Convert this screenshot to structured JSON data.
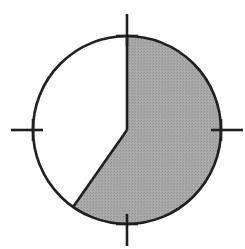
{
  "figure": {
    "name": "pie-sector-clock-diagram",
    "canvas": {
      "width": 245,
      "height": 249,
      "background": "#ffffff"
    }
  },
  "circle": {
    "center_x": 127,
    "center_y": 130,
    "radius": 94,
    "stroke_color": "#1f1f1f",
    "stroke_width": 2.6,
    "fill_color": "#ffffff"
  },
  "sector": {
    "label": "shaded-sector",
    "fill_color": "#a0a0a0",
    "texture": "halftone-dither",
    "start_angle_deg": 0,
    "end_angle_deg": 215,
    "sweep_deg": 215,
    "fraction_of_circle": 0.597,
    "start_clock_position": "12 o'clock",
    "end_clock_position": "lower-left"
  },
  "radii": [
    {
      "name": "radius-vertical-up",
      "angle_deg": 0,
      "from": "center",
      "to": "top of circle",
      "stroke_color": "#1f1f1f",
      "stroke_width": 2.6
    },
    {
      "name": "radius-diagonal-lower-left",
      "angle_deg": 215,
      "from": "center",
      "to": "lower-left edge of circle",
      "stroke_color": "#1f1f1f",
      "stroke_width": 2.6
    }
  ],
  "tick_marks": [
    {
      "name": "tick-north",
      "position": "top",
      "angle_deg": 0,
      "glyph": "plus-cross",
      "stroke_color": "#1f1f1f",
      "stroke_width": 2.6,
      "arm_outer": 22,
      "arm_inner": 10,
      "cross_arm": 11
    },
    {
      "name": "tick-east",
      "position": "right",
      "angle_deg": 90,
      "glyph": "plus-cross",
      "stroke_color": "#1f1f1f",
      "stroke_width": 2.6,
      "arm_outer": 22,
      "arm_inner": 10,
      "cross_arm": 11
    },
    {
      "name": "tick-south",
      "position": "bottom",
      "angle_deg": 180,
      "glyph": "plus-cross",
      "stroke_color": "#1f1f1f",
      "stroke_width": 2.6,
      "arm_outer": 22,
      "arm_inner": 10,
      "cross_arm": 11
    },
    {
      "name": "tick-west",
      "position": "left",
      "angle_deg": 270,
      "glyph": "plus-cross",
      "stroke_color": "#1f1f1f",
      "stroke_width": 2.6,
      "arm_outer": 22,
      "arm_inner": 10,
      "cross_arm": 11
    }
  ],
  "chart_data": {
    "type": "pie",
    "title": "",
    "labels": [
      "shaded sector",
      "unshaded sector"
    ],
    "values": [
      215,
      145
    ],
    "units": "degrees",
    "percentages": [
      59.7,
      40.3
    ],
    "colors": [
      "#a0a0a0",
      "#ffffff"
    ],
    "start_angle_deg": 0,
    "direction": "clockwise",
    "legend": "none",
    "grid": false,
    "annotations": [
      "cross tick mark at 12 o'clock (0 deg)",
      "cross tick mark at 3 o'clock (90 deg)",
      "cross tick mark at 6 o'clock (180 deg)",
      "cross tick mark at 9 o'clock (270 deg)"
    ]
  }
}
